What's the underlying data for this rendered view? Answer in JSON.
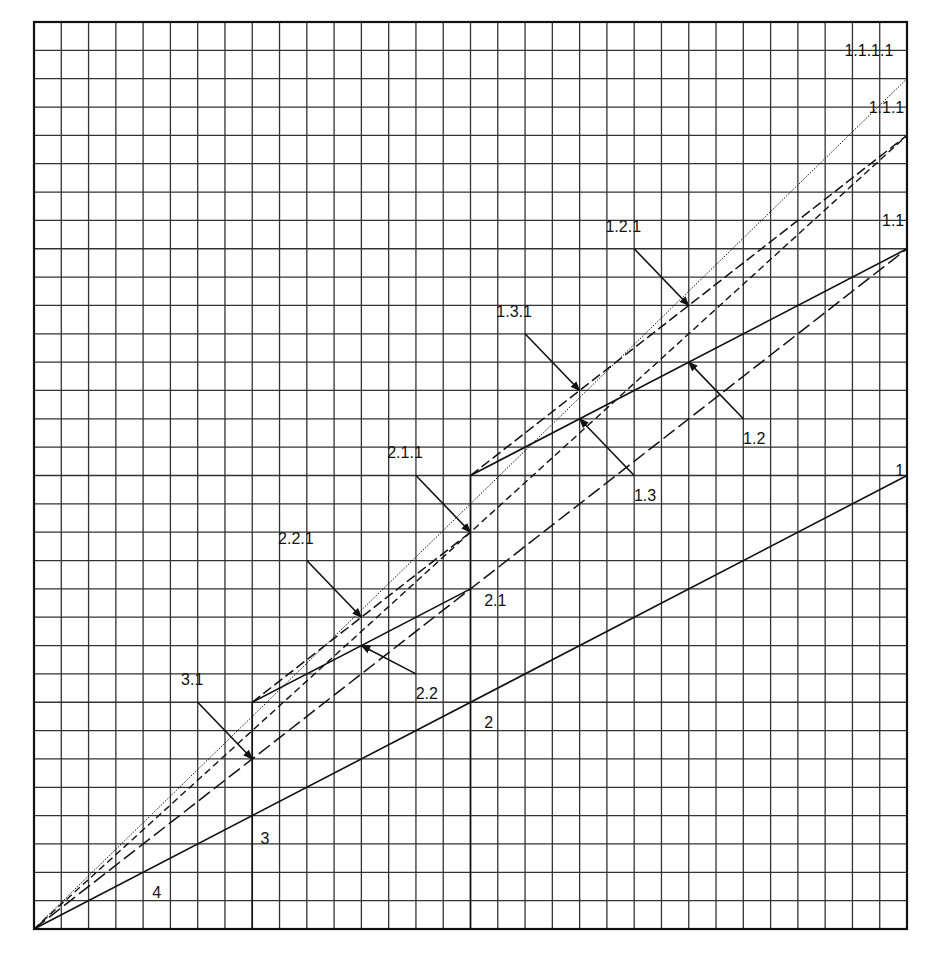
{
  "chart_data": {
    "type": "line",
    "title": "",
    "grid": {
      "cols": 32,
      "rows": 32,
      "visible": true
    },
    "xlim": [
      0,
      32
    ],
    "ylim": [
      0,
      32
    ],
    "lines": [
      {
        "name": "1",
        "style": "solid",
        "points": [
          [
            0,
            0
          ],
          [
            32,
            16
          ]
        ]
      },
      {
        "name": "1.1",
        "style": "longdash",
        "points": [
          [
            0,
            0
          ],
          [
            32,
            24
          ]
        ]
      },
      {
        "name": "1.1.1",
        "style": "shortdash",
        "points": [
          [
            0,
            0
          ],
          [
            32,
            28
          ]
        ]
      },
      {
        "name": "1.1.1.1",
        "style": "dotted",
        "points": [
          [
            0,
            0
          ],
          [
            32,
            30
          ]
        ]
      },
      {
        "name": "vertical-3",
        "style": "solid",
        "points": [
          [
            8,
            0
          ],
          [
            8,
            8
          ]
        ]
      },
      {
        "name": "vertical-2",
        "style": "solid",
        "points": [
          [
            16,
            0
          ],
          [
            16,
            16
          ]
        ]
      },
      {
        "name": "segment-2.x",
        "style": "solid",
        "points": [
          [
            8,
            8
          ],
          [
            16,
            12
          ]
        ]
      },
      {
        "name": "segment-1.x",
        "style": "solid",
        "points": [
          [
            16,
            16
          ],
          [
            32,
            24
          ]
        ]
      },
      {
        "name": "segment-2.x.1",
        "style": "mediumdash",
        "points": [
          [
            8,
            8
          ],
          [
            16,
            14
          ]
        ]
      },
      {
        "name": "segment-1.x.1",
        "style": "mediumdash",
        "points": [
          [
            16,
            16
          ],
          [
            32,
            28
          ]
        ]
      }
    ],
    "labels": [
      {
        "text": "1.1.1.1",
        "x": 31.5,
        "y": 30.8,
        "anchor": "end"
      },
      {
        "text": "1.1.1",
        "x": 31.9,
        "y": 28.8,
        "anchor": "end"
      },
      {
        "text": "1.1",
        "x": 31.9,
        "y": 24.8,
        "anchor": "end"
      },
      {
        "text": "1",
        "x": 31.9,
        "y": 16.0,
        "anchor": "end"
      },
      {
        "text": "1.2.1",
        "x": 21.6,
        "y": 24.6,
        "anchor": "middle"
      },
      {
        "text": "1.3.1",
        "x": 17.6,
        "y": 21.6,
        "anchor": "middle"
      },
      {
        "text": "1.2",
        "x": 26.4,
        "y": 17.1,
        "anchor": "middle"
      },
      {
        "text": "1.3",
        "x": 22.4,
        "y": 15.1,
        "anchor": "middle"
      },
      {
        "text": "2.1.1",
        "x": 13.6,
        "y": 16.6,
        "anchor": "middle"
      },
      {
        "text": "2.2.1",
        "x": 9.6,
        "y": 13.6,
        "anchor": "middle"
      },
      {
        "text": "2.1",
        "x": 16.5,
        "y": 11.4,
        "anchor": "start"
      },
      {
        "text": "2.2",
        "x": 14.4,
        "y": 8.1,
        "anchor": "middle"
      },
      {
        "text": "2",
        "x": 16.5,
        "y": 7.1,
        "anchor": "start"
      },
      {
        "text": "3.1",
        "x": 5.8,
        "y": 8.6,
        "anchor": "middle"
      },
      {
        "text": "3",
        "x": 8.3,
        "y": 3.0,
        "anchor": "start"
      },
      {
        "text": "4",
        "x": 4.5,
        "y": 1.1,
        "anchor": "middle"
      }
    ],
    "arrows": [
      {
        "label": "1.2.1",
        "from": [
          22,
          24
        ],
        "to": [
          24,
          22
        ]
      },
      {
        "label": "1.3.1",
        "from": [
          18,
          21
        ],
        "to": [
          20,
          19
        ]
      },
      {
        "label": "1.2",
        "from": [
          26,
          18
        ],
        "to": [
          24,
          20
        ]
      },
      {
        "label": "1.3",
        "from": [
          22,
          16
        ],
        "to": [
          20,
          18
        ]
      },
      {
        "label": "2.1.1",
        "from": [
          14,
          16
        ],
        "to": [
          16,
          14
        ]
      },
      {
        "label": "2.2.1",
        "from": [
          10,
          13
        ],
        "to": [
          12,
          11
        ]
      },
      {
        "label": "2.2",
        "from": [
          14,
          9
        ],
        "to": [
          12,
          10
        ]
      },
      {
        "label": "3.1",
        "from": [
          6,
          8
        ],
        "to": [
          8,
          6
        ]
      }
    ],
    "xlabel": "",
    "ylabel": ""
  },
  "colors": {
    "line": "#111111",
    "grid": "#333333",
    "background": "#ffffff"
  }
}
